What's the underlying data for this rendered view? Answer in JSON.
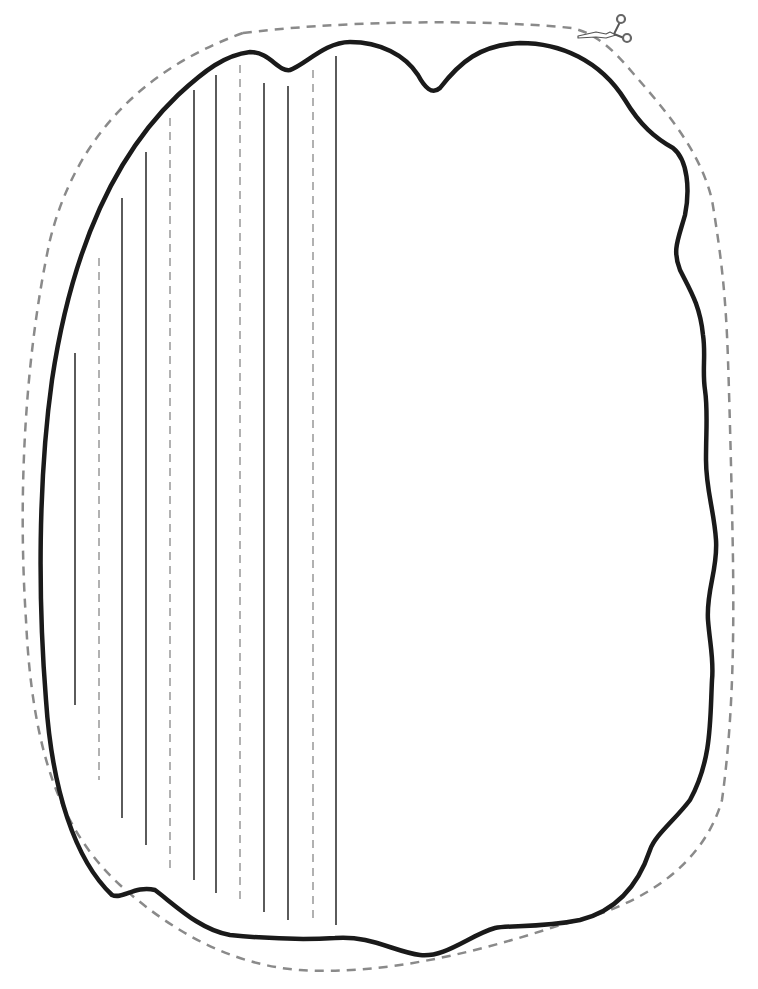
{
  "page": {
    "kind": "printable cut-out writing template",
    "background": "#ffffff"
  },
  "cut_line": {
    "label": "cut line",
    "color": "#8a8a8a",
    "style": "dashed"
  },
  "outline": {
    "label": "shape outline",
    "color": "#1a1a1a",
    "stroke_width": 4.5
  },
  "scissors_icon": {
    "name": "scissors-icon",
    "x": 578,
    "y": 12
  },
  "guide_lines": {
    "solid_color": "#333333",
    "dashed_color": "#888888",
    "lines": [
      {
        "x": 75,
        "y1": 353,
        "y2": 705,
        "style": "solid"
      },
      {
        "x": 99,
        "y1": 258,
        "y2": 780,
        "style": "dashed"
      },
      {
        "x": 122,
        "y1": 198,
        "y2": 818,
        "style": "solid"
      },
      {
        "x": 146,
        "y1": 152,
        "y2": 845,
        "style": "solid"
      },
      {
        "x": 170,
        "y1": 118,
        "y2": 870,
        "style": "dashed"
      },
      {
        "x": 194,
        "y1": 90,
        "y2": 880,
        "style": "solid"
      },
      {
        "x": 216,
        "y1": 75,
        "y2": 893,
        "style": "solid"
      },
      {
        "x": 240,
        "y1": 65,
        "y2": 905,
        "style": "dashed"
      },
      {
        "x": 264,
        "y1": 83,
        "y2": 912,
        "style": "solid"
      },
      {
        "x": 288,
        "y1": 86,
        "y2": 920,
        "style": "solid"
      },
      {
        "x": 313,
        "y1": 70,
        "y2": 922,
        "style": "dashed"
      },
      {
        "x": 336,
        "y1": 56,
        "y2": 925,
        "style": "solid"
      }
    ]
  }
}
